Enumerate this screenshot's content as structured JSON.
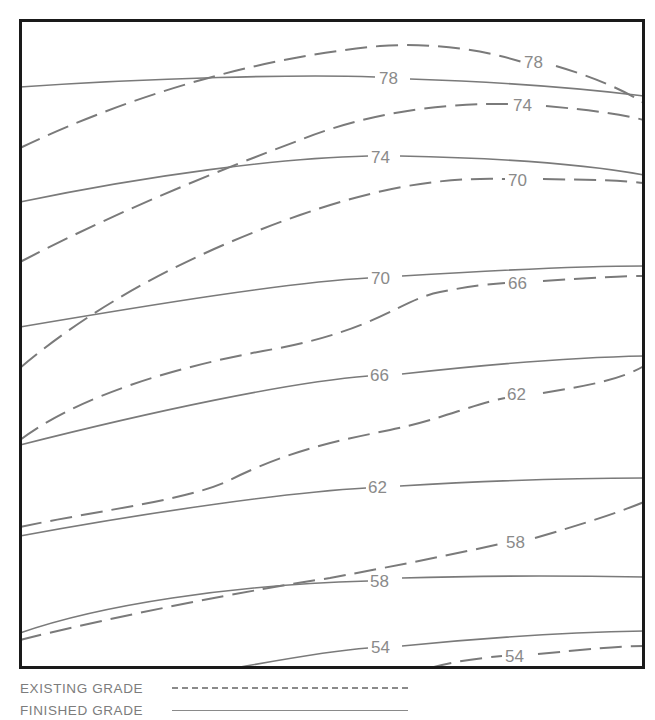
{
  "diagram": {
    "type": "contour grading plan",
    "contour_interval": 4,
    "existing_grade_contours": [
      {
        "elevation": "78",
        "label_x": 532,
        "label_y": 68
      },
      {
        "elevation": "74",
        "label_x": 520,
        "label_y": 111
      },
      {
        "elevation": "70",
        "label_x": 518,
        "label_y": 186
      },
      {
        "elevation": "66",
        "label_x": 518,
        "label_y": 289
      },
      {
        "elevation": "62",
        "label_x": 517,
        "label_y": 400
      },
      {
        "elevation": "58",
        "label_x": 517,
        "label_y": 548
      },
      {
        "elevation": "54",
        "label_x": 515,
        "label_y": 662
      }
    ],
    "finished_grade_contours": [
      {
        "elevation": "78",
        "label_x": 390,
        "label_y": 84
      },
      {
        "elevation": "74",
        "label_x": 381,
        "label_y": 163
      },
      {
        "elevation": "70",
        "label_x": 381,
        "label_y": 284
      },
      {
        "elevation": "66",
        "label_x": 380,
        "label_y": 381
      },
      {
        "elevation": "62",
        "label_x": 378,
        "label_y": 493
      },
      {
        "elevation": "58",
        "label_x": 380,
        "label_y": 587
      },
      {
        "elevation": "54",
        "label_x": 381,
        "label_y": 653
      }
    ]
  },
  "labels": {
    "e78": "78",
    "e74": "74",
    "e70": "70",
    "e66": "66",
    "e62": "62",
    "e58": "58",
    "e54": "54",
    "f78": "78",
    "f74": "74",
    "f70": "70",
    "f66": "66",
    "f62": "62",
    "f58": "58",
    "f54": "54"
  },
  "legend": {
    "existing_label": "EXISTING GRADE",
    "existing_style": "dashed",
    "finished_label": "FINISHED GRADE",
    "finished_style": "solid"
  },
  "colors": {
    "frame": "#1a1a1a",
    "contour": "#7a7a7a",
    "label": "#8a8a8a",
    "background": "#ffffff"
  }
}
